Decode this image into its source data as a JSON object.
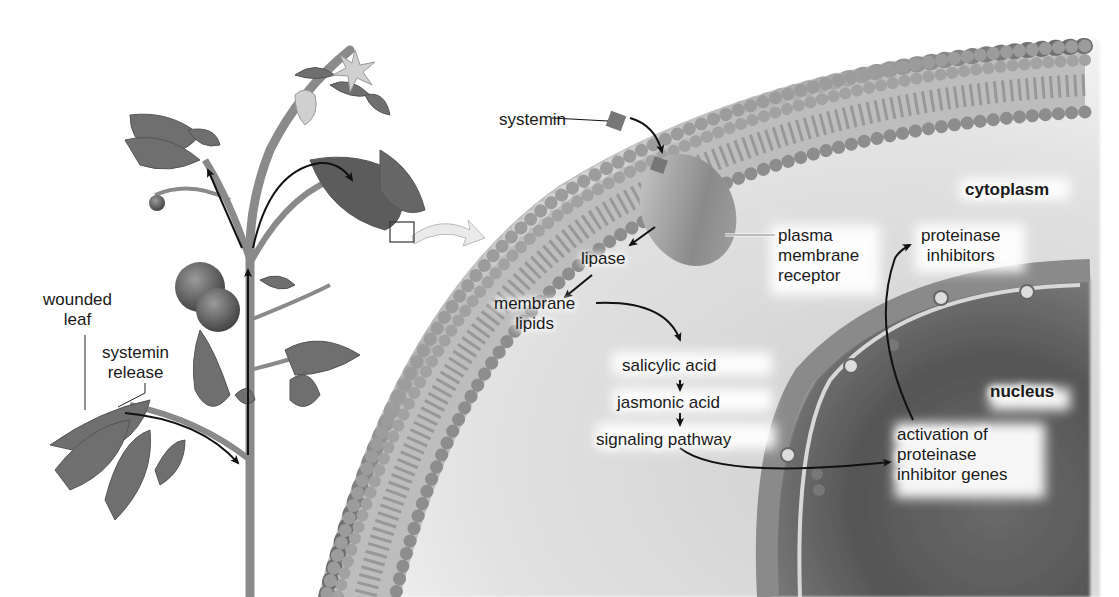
{
  "diagram": {
    "colors": {
      "background": "#ffffff",
      "text": "#1a1a1a",
      "arrow": "#111111",
      "plant": "#6f6f6f",
      "membrane_head": "#a9a9a9",
      "cytoplasm": "#d9d9d9",
      "nucleus": "#5e5e5e"
    },
    "plant_labels": {
      "wounded_leaf": "wounded\nleaf",
      "systemin_release": "systemin\nrelease"
    },
    "cell_labels": {
      "systemin": "systemin",
      "cytoplasm": "cytoplasm",
      "plasma_membrane_receptor": "plasma\nmembrane\nreceptor",
      "lipase": "lipase",
      "membrane_lipids": "membrane\nlipids",
      "proteinase_inhibitors": "proteinase\ninhibitors",
      "nucleus": "nucleus",
      "activation": "activation of\nproteinase\ninhibitor genes"
    },
    "pathway_steps": [
      "salicylic acid",
      "jasmonic acid",
      "signaling pathway"
    ],
    "nodes": [
      {
        "id": "systemin",
        "label": "systemin"
      },
      {
        "id": "receptor",
        "label": "plasma membrane receptor"
      },
      {
        "id": "lipase",
        "label": "lipase"
      },
      {
        "id": "membrane_lipids",
        "label": "membrane lipids"
      },
      {
        "id": "salicylic_acid",
        "label": "salicylic acid"
      },
      {
        "id": "jasmonic_acid",
        "label": "jasmonic acid"
      },
      {
        "id": "signaling_pathway",
        "label": "signaling pathway"
      },
      {
        "id": "gene_activation",
        "label": "activation of proteinase inhibitor genes"
      },
      {
        "id": "proteinase_inhibitors",
        "label": "proteinase inhibitors"
      }
    ],
    "edges": [
      {
        "from": "systemin",
        "to": "receptor"
      },
      {
        "from": "receptor",
        "to": "lipase"
      },
      {
        "from": "lipase",
        "to": "membrane_lipids"
      },
      {
        "from": "membrane_lipids",
        "to": "salicylic_acid"
      },
      {
        "from": "salicylic_acid",
        "to": "jasmonic_acid"
      },
      {
        "from": "jasmonic_acid",
        "to": "signaling_pathway"
      },
      {
        "from": "signaling_pathway",
        "to": "gene_activation"
      },
      {
        "from": "gene_activation",
        "to": "proteinase_inhibitors"
      }
    ]
  }
}
